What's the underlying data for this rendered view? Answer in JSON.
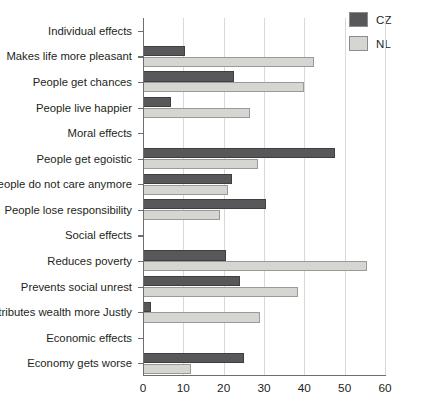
{
  "legend": {
    "position": "top-right",
    "entries": [
      {
        "label": "CZ",
        "color": "#58585b",
        "swatch_name": "legend-swatch-cz"
      },
      {
        "label": "NL",
        "color": "#d5d6d2",
        "swatch_name": "legend-swatch-nl"
      }
    ]
  },
  "chart_data": {
    "type": "bar",
    "orientation": "horizontal",
    "title": "",
    "subtitle": "",
    "xlabel": "",
    "ylabel": "",
    "xlim": [
      0,
      60
    ],
    "ylim": null,
    "grid": true,
    "gridline_axis": "x",
    "xticks": [
      0,
      10,
      20,
      30,
      40,
      50,
      60
    ],
    "xticklabels": [
      "0",
      "10",
      "20",
      "30",
      "40",
      "50",
      "60"
    ],
    "legend_position": "top-right",
    "categories": [
      "Individual effects",
      "Makes life more pleasant",
      "People get chances",
      "People live happier",
      "Moral effects",
      "People get egoistic",
      "People do not care anymore",
      "People lose responsibility",
      "Social effects",
      "Reduces poverty",
      "Prevents social unrest",
      "Distributes wealth more Justly",
      "Economic effects",
      "Economy gets worse"
    ],
    "category_is_header": [
      true,
      false,
      false,
      false,
      true,
      false,
      false,
      false,
      true,
      false,
      false,
      false,
      true,
      false
    ],
    "series": [
      {
        "name": "CZ",
        "color": "#58585b",
        "values": [
          null,
          10.5,
          22.5,
          7,
          null,
          47.5,
          22,
          30.5,
          null,
          20.5,
          24,
          2,
          null,
          25
        ]
      },
      {
        "name": "NL",
        "color": "#d5d6d2",
        "values": [
          null,
          42.5,
          40,
          26.5,
          null,
          28.5,
          21,
          19,
          null,
          55.5,
          38.5,
          29,
          null,
          12
        ]
      }
    ]
  },
  "colors": {
    "cz": "#58585b",
    "nl": "#d5d6d2",
    "axis": "#6d6e71",
    "grid": "#d9d9d9",
    "text": "#231f20",
    "background": "#ffffff"
  }
}
